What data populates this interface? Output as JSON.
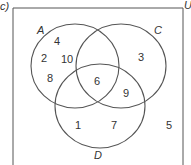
{
  "question_label": "c)",
  "universal_label": "U",
  "sets": [
    {
      "name": "A",
      "cx": 75,
      "cy": 66,
      "rx": 44,
      "ry": 42
    },
    {
      "name": "C",
      "cx": 121,
      "cy": 66,
      "rx": 45,
      "ry": 42
    },
    {
      "name": "D",
      "cx": 100,
      "cy": 106,
      "rx": 45,
      "ry": 42
    }
  ],
  "set_labels": {
    "A": "A",
    "C": "C",
    "D": "D"
  },
  "regions": {
    "A_only": [
      "4",
      "2",
      "10",
      "8"
    ],
    "C_only": [
      "3"
    ],
    "A_C_D": "6",
    "C_D_only": "9",
    "D_only": [
      "1",
      "7"
    ],
    "outside": "5"
  },
  "colors": {
    "stroke": "#555555",
    "text": "#333333",
    "background": "#ffffff"
  }
}
